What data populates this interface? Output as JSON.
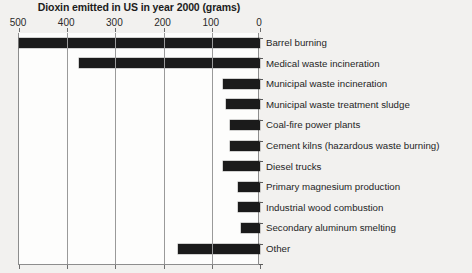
{
  "chart_data": {
    "type": "bar",
    "orientation": "horizontal",
    "title": "Dioxin emitted in US in year 2000 (grams)",
    "xlabel": "",
    "ylabel": "",
    "xlim": [
      500,
      0
    ],
    "axis_reversed": true,
    "grid": true,
    "legend": "none",
    "tick_labels": [
      "500",
      "400",
      "300",
      "200",
      "100",
      "0"
    ],
    "ticks": [
      500,
      400,
      300,
      200,
      100,
      0
    ],
    "categories": [
      "Barrel burning",
      "Medical waste incineration",
      "Municipal waste incineration",
      "Municipal waste treatment sludge",
      "Coal-fire power plants",
      "Cement kilns (hazardous waste burning)",
      "Diesel trucks",
      "Primary magnesium production",
      "Industrial wood combustion",
      "Secondary aluminum smelting",
      "Other"
    ],
    "values": [
      500,
      375,
      77,
      70,
      62,
      62,
      77,
      46,
      46,
      40,
      170
    ]
  },
  "colors": {
    "bar": "#1b1b1b",
    "axis": "#8d8d8d",
    "grid": "#9a9a9a",
    "text": "#1f1f1f",
    "background": "#f2f1ef",
    "plot_background": "#fdfdfc"
  }
}
